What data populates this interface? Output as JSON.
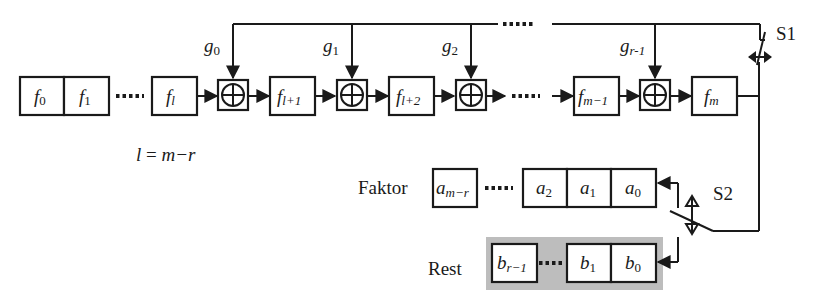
{
  "diagram": {
    "colors": {
      "stroke": "#1a1a1a",
      "rest_background": "#bdbdbd",
      "box_fill": "#ffffff"
    },
    "dividend_register": {
      "cells": [
        {
          "base": "f",
          "sub": "0"
        },
        {
          "base": "f",
          "sub": "1"
        },
        {
          "base": "f",
          "sub": "l"
        },
        {
          "base": "f",
          "sub": "l+1"
        },
        {
          "base": "f",
          "sub": "l+2"
        },
        {
          "base": "f",
          "sub": "m−1"
        },
        {
          "base": "f",
          "sub": "m"
        }
      ]
    },
    "feedback_coefficients": [
      {
        "base": "g",
        "sub": "0"
      },
      {
        "base": "g",
        "sub": "1"
      },
      {
        "base": "g",
        "sub": "2"
      },
      {
        "base": "g",
        "sub": "r-1"
      }
    ],
    "xor_symbol": "⊕",
    "equation": {
      "lhs": "l",
      "eq": " = ",
      "rhs": "m−r"
    },
    "switches": {
      "s1": "S1",
      "s2": "S2"
    },
    "quotient": {
      "label": "Faktor",
      "cells": [
        {
          "base": "a",
          "sub": "m−r"
        },
        {
          "base": "a",
          "sub": "2"
        },
        {
          "base": "a",
          "sub": "1"
        },
        {
          "base": "a",
          "sub": "0"
        }
      ]
    },
    "remainder": {
      "label": "Rest",
      "cells": [
        {
          "base": "b",
          "sub": "r−1"
        },
        {
          "base": "b",
          "sub": "1"
        },
        {
          "base": "b",
          "sub": "0"
        }
      ]
    }
  }
}
